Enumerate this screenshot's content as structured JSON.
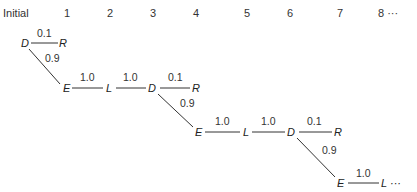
{
  "header": {
    "stages": [
      "Initial",
      "1",
      "2",
      "3",
      "4",
      "5",
      "6",
      "7",
      "8 ···"
    ]
  },
  "diagram": {
    "nodes": [
      {
        "id": "n1",
        "label": "D"
      },
      {
        "id": "n2",
        "label": "R"
      },
      {
        "id": "n3",
        "label": "E"
      },
      {
        "id": "n4",
        "label": "L"
      },
      {
        "id": "n5",
        "label": "D"
      },
      {
        "id": "n6",
        "label": "R"
      },
      {
        "id": "n7",
        "label": "E"
      },
      {
        "id": "n8",
        "label": "L"
      },
      {
        "id": "n9",
        "label": "D"
      },
      {
        "id": "n10",
        "label": "R"
      },
      {
        "id": "n11",
        "label": "E"
      },
      {
        "id": "n12",
        "label": "L ···"
      }
    ],
    "edges": [
      {
        "from": "n1",
        "to": "n2",
        "prob": "0.1"
      },
      {
        "from": "n1",
        "to": "n3",
        "prob": "0.9"
      },
      {
        "from": "n3",
        "to": "n4",
        "prob": "1.0"
      },
      {
        "from": "n4",
        "to": "n5",
        "prob": "1.0"
      },
      {
        "from": "n5",
        "to": "n6",
        "prob": "0.1"
      },
      {
        "from": "n5",
        "to": "n7",
        "prob": "0.9"
      },
      {
        "from": "n7",
        "to": "n8",
        "prob": "1.0"
      },
      {
        "from": "n8",
        "to": "n9",
        "prob": "1.0"
      },
      {
        "from": "n9",
        "to": "n10",
        "prob": "0.1"
      },
      {
        "from": "n9",
        "to": "n11",
        "prob": "0.9"
      },
      {
        "from": "n11",
        "to": "n12",
        "prob": "1.0"
      }
    ]
  }
}
